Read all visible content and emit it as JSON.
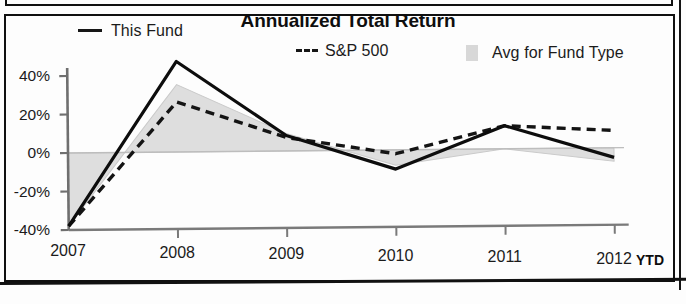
{
  "panel": {
    "title": "Annualized Total Return"
  },
  "legend": {
    "items": [
      {
        "label": "This Fund",
        "swatch": "solid-line",
        "color": "#161616"
      },
      {
        "label": "S&P 500",
        "swatch": "dashed-line",
        "color": "#161616"
      },
      {
        "label": "Avg for Fund Type",
        "swatch": "filled-area",
        "color": "#d8d8d8"
      }
    ]
  },
  "axes": {
    "y_ticks": [
      "40%",
      "20%",
      "0%",
      "-20%",
      "-40%"
    ],
    "x_ticks": [
      "2007",
      "2008",
      "2009",
      "2010",
      "2011",
      "2012"
    ],
    "x_suffix": "YTD"
  },
  "chart_data": {
    "type": "line",
    "title": "Annualized Total Return",
    "xlabel": "",
    "ylabel": "",
    "x": [
      "2007",
      "2008",
      "2009",
      "2010",
      "2011",
      "2012"
    ],
    "categories": [
      "2007",
      "2008",
      "2009",
      "2010",
      "2011",
      "2012"
    ],
    "ylim": [
      -40,
      40
    ],
    "y_ticks": [
      40,
      20,
      0,
      -20,
      -40
    ],
    "y_tick_labels": [
      "40%",
      "20%",
      "0%",
      "-20%",
      "-40%"
    ],
    "x_tick_labels": [
      "2007",
      "2008",
      "2009",
      "2010",
      "2011",
      "2012"
    ],
    "x_axis_note": "YTD",
    "grid": false,
    "zero_line": true,
    "legend_position": "top",
    "series": [
      {
        "name": "This Fund",
        "style": "solid",
        "color": "#161616",
        "values": [
          -38,
          47,
          8,
          -10,
          12,
          -5
        ]
      },
      {
        "name": "S&P 500",
        "style": "dashed",
        "color": "#161616",
        "values": [
          -38,
          26,
          7,
          -2,
          12,
          9
        ]
      },
      {
        "name": "Avg for Fund Type",
        "style": "area",
        "color": "#d8d8d8",
        "values": [
          -38,
          35,
          9,
          -8,
          0,
          -7
        ]
      }
    ]
  }
}
